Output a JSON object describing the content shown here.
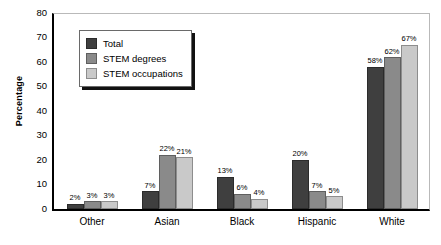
{
  "chart_data": {
    "type": "bar",
    "title": "",
    "xlabel": "",
    "ylabel": "Percentage",
    "ylim": [
      0,
      80
    ],
    "yticks": [
      0,
      10,
      20,
      30,
      40,
      50,
      60,
      70,
      80
    ],
    "grid": false,
    "legend_position": "top-left",
    "value_suffix": "%",
    "categories": [
      "Other",
      "Asian",
      "Black",
      "Hispanic",
      "White"
    ],
    "series": [
      {
        "name": "Total",
        "color": "#3f3f3f",
        "values": [
          2,
          7,
          13,
          20,
          58
        ],
        "labels": [
          "2%",
          "7%",
          "13%",
          "20%",
          "58%"
        ]
      },
      {
        "name": "STEM degrees",
        "color": "#8a8a8a",
        "values": [
          3,
          22,
          6,
          7,
          62
        ],
        "labels": [
          "3%",
          "22%",
          "6%",
          "7%",
          "62%"
        ]
      },
      {
        "name": "STEM occupations",
        "color": "#c9c9c9",
        "values": [
          3,
          21,
          4,
          5,
          67
        ],
        "labels": [
          "3%",
          "21%",
          "4%",
          "5%",
          "67%"
        ]
      }
    ]
  },
  "axis": {
    "y_title": "Percentage",
    "y_tick_labels": [
      "0",
      "10",
      "20",
      "30",
      "40",
      "50",
      "60",
      "70",
      "80"
    ],
    "x_tick_labels": [
      "Other",
      "Asian",
      "Black",
      "Hispanic",
      "White"
    ]
  },
  "legend": {
    "items": [
      {
        "label": "Total",
        "swatch": "dark-gray-swatch"
      },
      {
        "label": "STEM degrees",
        "swatch": "medium-gray-swatch"
      },
      {
        "label": "STEM occupations",
        "swatch": "light-gray-swatch"
      }
    ]
  }
}
